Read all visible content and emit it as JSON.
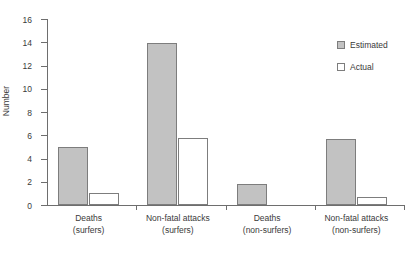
{
  "chart_data": {
    "type": "bar",
    "title": "",
    "xlabel": "",
    "ylabel": "Number",
    "ylim": [
      0,
      16
    ],
    "yticks": [
      0,
      2,
      4,
      6,
      8,
      10,
      12,
      14,
      16
    ],
    "grid": false,
    "legend_position": "top-right",
    "categories": [
      "Deaths (surfers)",
      "Non-fatal attacks (surfers)",
      "Deaths (non-surfers)",
      "Non-fatal attacks (non-surfers)"
    ],
    "category_lines": [
      {
        "line1": "Deaths",
        "line2": "(surfers)"
      },
      {
        "line1": "Non-fatal attacks",
        "line2": "(surfers)"
      },
      {
        "line1": "Deaths",
        "line2": "(non-surfers)"
      },
      {
        "line1": "Non-fatal attacks",
        "line2": "(non-surfers)"
      }
    ],
    "series": [
      {
        "name": "Estimated",
        "color": "#c2c2c2",
        "values": [
          5.0,
          13.9,
          1.8,
          5.7
        ]
      },
      {
        "name": "Actual",
        "color": "#ffffff",
        "values": [
          1.0,
          5.8,
          0.0,
          0.7
        ]
      }
    ]
  },
  "legend": {
    "items": [
      {
        "label": "Estimated",
        "swatch": "estimated"
      },
      {
        "label": "Actual",
        "swatch": "actual"
      }
    ]
  },
  "axes": {
    "y_title": "Number",
    "y_tick_labels": [
      "16",
      "14",
      "12",
      "10",
      "8",
      "6",
      "4",
      "2",
      "0"
    ]
  }
}
